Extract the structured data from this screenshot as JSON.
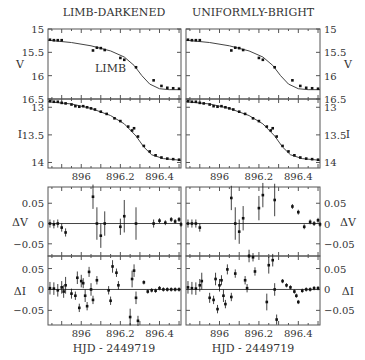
{
  "titles": {
    "left": "LIMB-DARKENED",
    "right": "UNIFORMLY-BRIGHT"
  },
  "annotation": "LIMB",
  "xlabel": "HJD - 2449719",
  "colors": {
    "axis": "#555555",
    "data": "#111111",
    "fit": "#444444",
    "text": "#333333"
  },
  "chart_data": {
    "type": "scatter",
    "xlabel": "HJD - 2449719",
    "xticks": [
      896,
      896.2,
      896.4
    ],
    "xlim": [
      895.83,
      896.51
    ],
    "columns": [
      "LIMB-DARKENED",
      "UNIFORMLY-BRIGHT"
    ],
    "panels": [
      {
        "name": "V",
        "ylabel": "V",
        "ylim": [
          15,
          16.5
        ],
        "inverted": true,
        "yticks": [
          15,
          15.5,
          16,
          16.5
        ],
        "fit": [
          [
            895.83,
            15.24
          ],
          [
            895.95,
            15.29
          ],
          [
            896.05,
            15.36
          ],
          [
            896.15,
            15.47
          ],
          [
            896.22,
            15.6
          ],
          [
            896.27,
            15.78
          ],
          [
            896.31,
            16.0
          ],
          [
            896.35,
            16.18
          ],
          [
            896.4,
            16.28
          ],
          [
            896.45,
            16.3
          ],
          [
            896.51,
            16.3
          ]
        ],
        "points": [
          [
            895.84,
            15.23
          ],
          [
            895.86,
            15.24
          ],
          [
            895.88,
            15.24
          ],
          [
            895.9,
            15.24
          ],
          [
            896.06,
            15.46
          ],
          [
            896.08,
            15.4
          ],
          [
            896.1,
            15.41
          ],
          [
            896.12,
            15.45
          ],
          [
            896.2,
            15.62
          ],
          [
            896.22,
            15.66
          ],
          [
            896.28,
            15.82
          ],
          [
            896.37,
            16.1
          ],
          [
            896.41,
            16.22
          ],
          [
            896.44,
            16.26
          ],
          [
            896.47,
            16.27
          ],
          [
            896.5,
            16.28
          ]
        ]
      },
      {
        "name": "I",
        "ylabel": "I",
        "ylim": [
          12.85,
          14.1
        ],
        "inverted": true,
        "yticks": [
          13,
          13.5,
          14
        ],
        "fit": [
          [
            895.83,
            12.9
          ],
          [
            895.95,
            12.94
          ],
          [
            896.05,
            13.02
          ],
          [
            896.15,
            13.15
          ],
          [
            896.22,
            13.3
          ],
          [
            896.28,
            13.52
          ],
          [
            896.32,
            13.72
          ],
          [
            896.36,
            13.86
          ],
          [
            896.42,
            13.93
          ],
          [
            896.51,
            13.96
          ]
        ],
        "points": [
          [
            895.84,
            12.89
          ],
          [
            895.86,
            12.9
          ],
          [
            895.88,
            12.9
          ],
          [
            895.9,
            12.92
          ],
          [
            895.92,
            12.93
          ],
          [
            895.95,
            12.95
          ],
          [
            895.97,
            12.98
          ],
          [
            895.99,
            12.99
          ],
          [
            896.01,
            12.98
          ],
          [
            896.03,
            13.0
          ],
          [
            896.05,
            13.02
          ],
          [
            896.07,
            13.04
          ],
          [
            896.1,
            13.08
          ],
          [
            896.13,
            13.12
          ],
          [
            896.17,
            13.2
          ],
          [
            896.2,
            13.25
          ],
          [
            896.24,
            13.35
          ],
          [
            896.26,
            13.42
          ],
          [
            896.27,
            13.38
          ],
          [
            896.29,
            13.53
          ],
          [
            896.32,
            13.7
          ],
          [
            896.35,
            13.8
          ],
          [
            896.38,
            13.87
          ],
          [
            896.41,
            13.91
          ],
          [
            896.44,
            13.93
          ],
          [
            896.47,
            13.94
          ],
          [
            896.5,
            13.95
          ]
        ]
      },
      {
        "name": "dV",
        "ylabel": "ΔV",
        "ylim": [
          -0.08,
          0.09
        ],
        "inverted": false,
        "yticks": [
          0.05,
          0,
          -0.05
        ],
        "points_left": [
          [
            895.84,
            0,
            0.01
          ],
          [
            895.86,
            -0.002,
            0.01
          ],
          [
            895.88,
            0,
            0.01
          ],
          [
            895.9,
            -0.01,
            0.01
          ],
          [
            895.92,
            -0.022,
            0.01
          ],
          [
            896.06,
            0.066,
            0.03
          ],
          [
            896.08,
            0,
            0.04
          ],
          [
            896.1,
            -0.03,
            0.03
          ],
          [
            896.12,
            0,
            0.03
          ],
          [
            896.2,
            -0.008,
            0.02
          ],
          [
            896.22,
            0.018,
            0.04
          ],
          [
            896.28,
            0,
            0.04
          ],
          [
            896.37,
            0,
            0.01
          ],
          [
            896.4,
            0.007,
            0.006
          ],
          [
            896.43,
            0.002,
            0.006
          ],
          [
            896.46,
            0.01,
            0.006
          ],
          [
            896.48,
            0.005,
            0.006
          ],
          [
            896.5,
            0.01,
            0.006
          ],
          [
            896.51,
            -0.002,
            0.006
          ]
        ],
        "points_right": [
          [
            895.84,
            0,
            0.01
          ],
          [
            895.86,
            0,
            0.01
          ],
          [
            895.88,
            0,
            0.01
          ],
          [
            895.9,
            -0.01,
            0.01
          ],
          [
            896.06,
            0.063,
            0.03
          ],
          [
            896.08,
            0,
            0.04
          ],
          [
            896.1,
            -0.02,
            0.03
          ],
          [
            896.12,
            0.013,
            0.03
          ],
          [
            896.2,
            0.038,
            0.03
          ],
          [
            896.22,
            0.07,
            0.03
          ],
          [
            896.28,
            0.058,
            0.04
          ],
          [
            896.37,
            0.042,
            0.006
          ],
          [
            896.4,
            0.028,
            0.006
          ],
          [
            896.43,
            -0.008,
            0.006
          ],
          [
            896.46,
            0.004,
            0.006
          ],
          [
            896.48,
            0,
            0.006
          ],
          [
            896.5,
            0.008,
            0.006
          ],
          [
            896.51,
            -0.002,
            0.006
          ]
        ]
      },
      {
        "name": "dI",
        "ylabel": "ΔI",
        "ylim": [
          -0.085,
          0.08
        ],
        "inverted": false,
        "yticks": [
          0.05,
          0,
          -0.05
        ],
        "points_left": [
          [
            895.84,
            0.003,
            0.015
          ],
          [
            895.86,
            0.002,
            0.015
          ],
          [
            895.88,
            -0.002,
            0.015
          ],
          [
            895.9,
            0.005,
            0.015
          ],
          [
            895.91,
            -0.005,
            0.015
          ],
          [
            895.92,
            0.01,
            0.02
          ],
          [
            895.95,
            -0.01,
            0.012
          ],
          [
            895.97,
            -0.015,
            0.01
          ],
          [
            895.98,
            0.028,
            0.015
          ],
          [
            895.99,
            -0.044,
            0.01
          ],
          [
            896.0,
            0.02,
            0.015
          ],
          [
            896.01,
            0.015,
            0.012
          ],
          [
            896.02,
            -0.015,
            0.015
          ],
          [
            896.03,
            -0.04,
            0.01
          ],
          [
            896.04,
            0.042,
            0.012
          ],
          [
            896.05,
            0.0,
            0.015
          ],
          [
            896.06,
            -0.025,
            0.01
          ],
          [
            896.08,
            0.022,
            0.01
          ],
          [
            896.14,
            -0.002,
            0.01
          ],
          [
            896.15,
            -0.027,
            0.01
          ],
          [
            896.16,
            0.055,
            0.015
          ],
          [
            896.18,
            0.04,
            0.01
          ],
          [
            896.19,
            0.01,
            0.01
          ],
          [
            896.25,
            -0.066,
            0.02
          ],
          [
            896.26,
            0.025,
            0.02
          ],
          [
            896.27,
            0.045,
            0.015
          ],
          [
            896.28,
            -0.02,
            0.015
          ],
          [
            896.29,
            -0.075,
            0.012
          ],
          [
            896.32,
            0.017,
            0.005
          ],
          [
            896.34,
            -0.005,
            0.005
          ],
          [
            896.36,
            -0.002,
            0.005
          ],
          [
            896.38,
            -0.003,
            0.005
          ],
          [
            896.4,
            0.003,
            0.005
          ],
          [
            896.42,
            0.0,
            0.005
          ],
          [
            896.44,
            0.0,
            0.005
          ],
          [
            896.46,
            0.0,
            0.005
          ],
          [
            896.48,
            0.0,
            0.005
          ],
          [
            896.5,
            0.0,
            0.005
          ]
        ],
        "points_right": [
          [
            895.84,
            0.005,
            0.015
          ],
          [
            895.86,
            0.003,
            0.015
          ],
          [
            895.88,
            0.002,
            0.015
          ],
          [
            895.9,
            0.01,
            0.015
          ],
          [
            895.91,
            0.02,
            0.02
          ],
          [
            895.95,
            -0.02,
            0.012
          ],
          [
            895.97,
            -0.025,
            0.01
          ],
          [
            895.98,
            0.025,
            0.015
          ],
          [
            895.99,
            -0.047,
            0.01
          ],
          [
            896.0,
            0.01,
            0.015
          ],
          [
            896.01,
            0.022,
            0.012
          ],
          [
            896.02,
            -0.015,
            0.015
          ],
          [
            896.03,
            -0.035,
            0.01
          ],
          [
            896.04,
            0.048,
            0.012
          ],
          [
            896.06,
            -0.018,
            0.01
          ],
          [
            896.08,
            0.038,
            0.01
          ],
          [
            896.13,
            0.022,
            0.01
          ],
          [
            896.14,
            0.003,
            0.01
          ],
          [
            896.15,
            0.08,
            0.015
          ],
          [
            896.17,
            0.077,
            0.01
          ],
          [
            896.18,
            0.043,
            0.01
          ],
          [
            896.24,
            -0.03,
            0.02
          ],
          [
            896.25,
            0.058,
            0.02
          ],
          [
            896.27,
            0.07,
            0.015
          ],
          [
            896.28,
            0.0,
            0.015
          ],
          [
            896.29,
            -0.072,
            0.012
          ],
          [
            896.32,
            0.02,
            0.005
          ],
          [
            896.34,
            0.01,
            0.005
          ],
          [
            896.36,
            0.005,
            0.005
          ],
          [
            896.38,
            -0.005,
            0.005
          ],
          [
            896.39,
            -0.015,
            0.005
          ],
          [
            896.4,
            -0.03,
            0.005
          ],
          [
            896.42,
            -0.003,
            0.005
          ],
          [
            896.44,
            0.0,
            0.005
          ],
          [
            896.46,
            0.0,
            0.005
          ],
          [
            896.48,
            0.003,
            0.005
          ],
          [
            896.5,
            0.003,
            0.005
          ]
        ]
      }
    ]
  }
}
